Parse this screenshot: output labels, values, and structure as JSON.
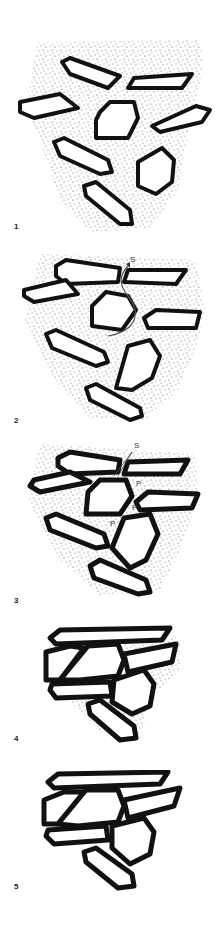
{
  "figure": {
    "panels": [
      {
        "label": "1",
        "description": "Loose grains (elongate prisms and equant polygons) floating in stippled matrix"
      },
      {
        "label": "2",
        "description": "Grains closer; fluid flow path marked with arrow toward S",
        "annotations": [
          "S"
        ]
      },
      {
        "label": "3",
        "description": "Grains in contact; pressure points P, solution S",
        "annotations": [
          "S",
          "P",
          "P",
          "P"
        ]
      },
      {
        "label": "4",
        "description": "Grains compacted with interlocking boundaries; residual matrix"
      },
      {
        "label": "5",
        "description": "Fully compacted interlocking grain fabric, no matrix"
      }
    ],
    "colors": {
      "outline": "#111111",
      "matrix_stipple": "#555555",
      "background": "#ffffff"
    }
  }
}
